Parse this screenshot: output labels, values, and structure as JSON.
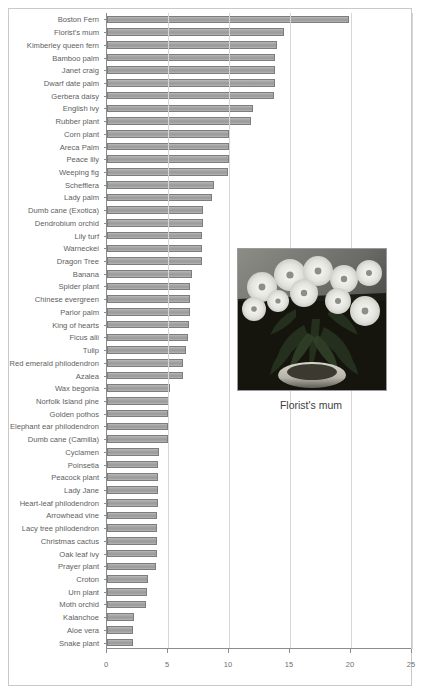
{
  "chart_data": {
    "type": "bar",
    "orientation": "horizontal",
    "title": "",
    "xlabel": "",
    "ylabel": "",
    "xlim": [
      0,
      25
    ],
    "xticks": [
      0,
      5,
      10,
      15,
      20,
      25
    ],
    "grid": true,
    "legend": false,
    "bar_color": "#a2a2a2",
    "bar_edge_color": "#7d7d7d",
    "categories": [
      "Boston Fern",
      "Florist's mum",
      "Kimberley queen fern",
      "Bamboo palm",
      "Janet craig",
      "Dwarf date palm",
      "Gerbera daisy",
      "English ivy",
      "Rubber plant",
      "Corn plant",
      "Areca Palm",
      "Peace lily",
      "Weeping fig",
      "Schefflera",
      "Lady palm",
      "Dumb cane (Exotica)",
      "Dendrobium orchid",
      "Lily turf",
      "Warneckei",
      "Dragon Tree",
      "Banana",
      "Spider plant",
      "Chinese evergreen",
      "Parlor palm",
      "King of hearts",
      "Ficus alii",
      "Tulip",
      "Red emerald philodendron",
      "Azalea",
      "Wax begonia",
      "Norfolk Island pine",
      "Golden pothos",
      "Elephant ear philodendron",
      "Dumb cane (Camilla)",
      "Cyclamen",
      "Poinsetia",
      "Peacock plant",
      "Lady Jane",
      "Heart-leaf philodendron",
      "Arrowhead vine",
      "Lacy tree philodendron",
      "Christmas cactus",
      "Oak leaf ivy",
      "Prayer plant",
      "Croton",
      "Urn plant",
      "Moth orchid",
      "Kalanchoe",
      "Aloe vera",
      "Snake plant"
    ],
    "values": [
      19.8,
      14.5,
      13.9,
      13.8,
      13.8,
      13.8,
      13.7,
      12.0,
      11.8,
      10.0,
      10.0,
      10.0,
      9.9,
      8.8,
      8.6,
      7.9,
      7.9,
      7.8,
      7.8,
      7.8,
      7.0,
      6.8,
      6.8,
      6.8,
      6.7,
      6.6,
      6.5,
      6.2,
      6.2,
      5.2,
      5.1,
      5.0,
      5.0,
      5.0,
      4.3,
      4.2,
      4.2,
      4.2,
      4.2,
      4.1,
      4.1,
      4.1,
      4.1,
      4.0,
      3.4,
      3.3,
      3.2,
      2.2,
      2.1,
      2.1
    ]
  },
  "inset": {
    "caption": "Florist's mum",
    "image_name": "florists-mum-photo"
  },
  "source_note": ""
}
